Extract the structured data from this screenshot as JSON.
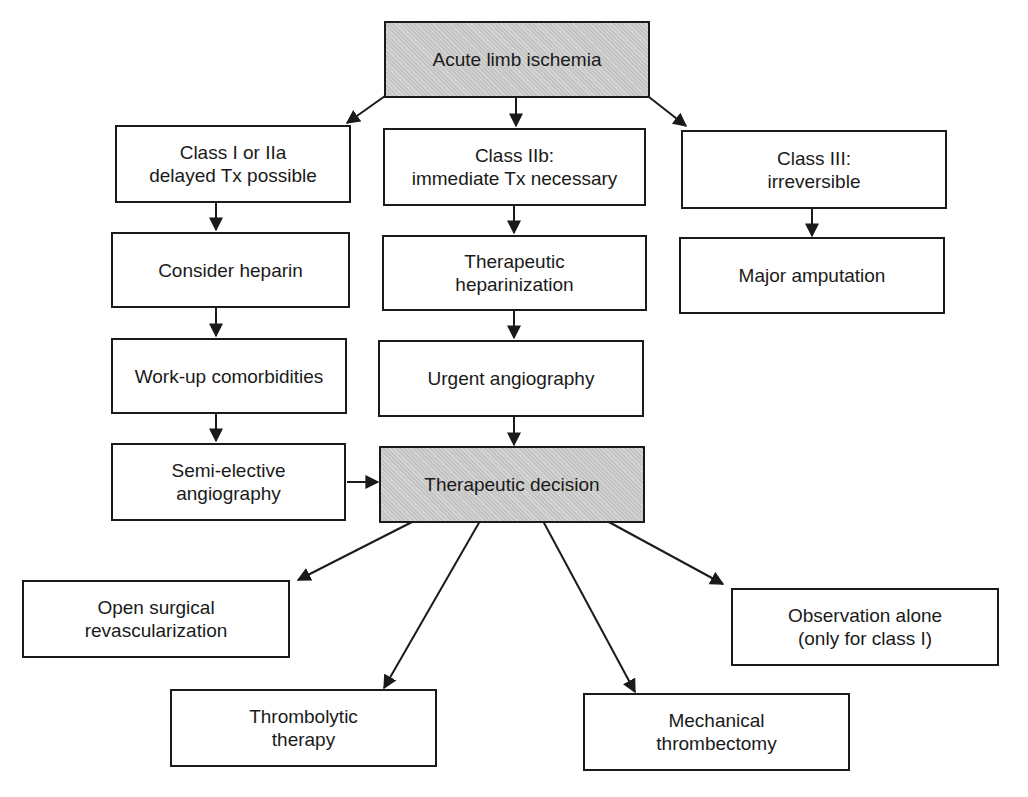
{
  "diagram": {
    "type": "flowchart",
    "nodes": {
      "root": {
        "lines": [
          "Acute limb ischemia"
        ],
        "shaded": true
      },
      "class_i_iia": {
        "lines": [
          "Class I or IIa",
          "delayed Tx possible"
        ]
      },
      "class_iib": {
        "lines": [
          "Class IIb:",
          "immediate Tx necessary"
        ]
      },
      "class_iii": {
        "lines": [
          "Class III:",
          "irreversible"
        ]
      },
      "consider_heparin": {
        "lines": [
          "Consider heparin"
        ]
      },
      "therapeutic_heparinization": {
        "lines": [
          "Therapeutic",
          "heparinization"
        ]
      },
      "major_amputation": {
        "lines": [
          "Major amputation"
        ]
      },
      "workup_comorbidities": {
        "lines": [
          "Work-up comorbidities"
        ]
      },
      "urgent_angiography": {
        "lines": [
          "Urgent angiography"
        ]
      },
      "semi_elective_angiography": {
        "lines": [
          "Semi-elective",
          "angiography"
        ]
      },
      "therapeutic_decision": {
        "lines": [
          "Therapeutic decision"
        ],
        "shaded": true
      },
      "open_surgical": {
        "lines": [
          "Open surgical",
          "revascularization"
        ]
      },
      "observation_alone": {
        "lines": [
          "Observation alone",
          "(only for class I)"
        ]
      },
      "thrombolytic": {
        "lines": [
          "Thrombolytic",
          "therapy"
        ]
      },
      "mechanical": {
        "lines": [
          "Mechanical",
          "thrombectomy"
        ]
      }
    },
    "edges": [
      [
        "root",
        "class_i_iia"
      ],
      [
        "root",
        "class_iib"
      ],
      [
        "root",
        "class_iii"
      ],
      [
        "class_i_iia",
        "consider_heparin"
      ],
      [
        "consider_heparin",
        "workup_comorbidities"
      ],
      [
        "workup_comorbidities",
        "semi_elective_angiography"
      ],
      [
        "semi_elective_angiography",
        "therapeutic_decision"
      ],
      [
        "class_iib",
        "therapeutic_heparinization"
      ],
      [
        "therapeutic_heparinization",
        "urgent_angiography"
      ],
      [
        "urgent_angiography",
        "therapeutic_decision"
      ],
      [
        "class_iii",
        "major_amputation"
      ],
      [
        "therapeutic_decision",
        "open_surgical"
      ],
      [
        "therapeutic_decision",
        "thrombolytic"
      ],
      [
        "therapeutic_decision",
        "mechanical"
      ],
      [
        "therapeutic_decision",
        "observation_alone"
      ]
    ],
    "colors": {
      "line": "#1a1a1a",
      "shaded_fill": "#cfcfcf",
      "box_fill": "#ffffff"
    }
  }
}
